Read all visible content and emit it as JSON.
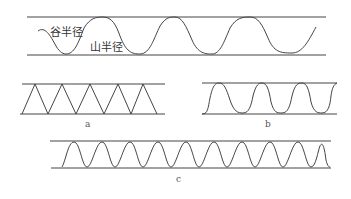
{
  "top_panel": {
    "valley_label": "谷半径",
    "peak_label": "山半径"
  },
  "panels": [
    {
      "id": "a",
      "label": "a",
      "shape": "triangle-zigzag"
    },
    {
      "id": "b",
      "label": "b",
      "shape": "square-ish-wave"
    },
    {
      "id": "c",
      "label": "c",
      "shape": "narrow-sine-wave"
    }
  ],
  "colors": {
    "line": "#444444",
    "background": "#ffffff"
  }
}
